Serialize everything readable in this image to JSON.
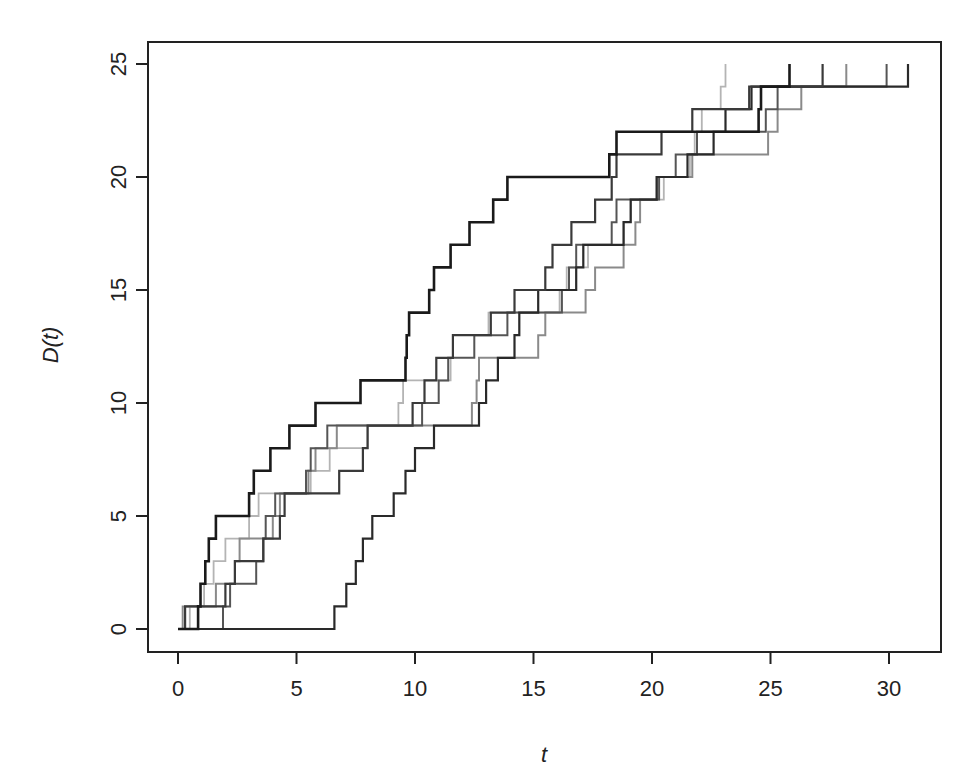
{
  "chart_data": {
    "type": "line",
    "subtype": "step",
    "title": "",
    "xlabel": "t",
    "ylabel": "D(t)",
    "xlim": [
      -1.2,
      32.2
    ],
    "ylim": [
      -1.0,
      25.9
    ],
    "xticks": [
      0,
      5,
      10,
      15,
      20,
      25,
      30
    ],
    "xtick_labels": [
      "0",
      "5",
      "10",
      "15",
      "20",
      "25",
      "30"
    ],
    "yticks": [
      0,
      5,
      10,
      15,
      20,
      25
    ],
    "ytick_labels": [
      "0",
      "5",
      "10",
      "15",
      "20",
      "25"
    ],
    "grid": false,
    "legend": null,
    "series": [
      {
        "name": "curve-1",
        "color": "#1a1a1a",
        "width": 2.6,
        "steps": [
          [
            0,
            0
          ],
          [
            0.85,
            1
          ],
          [
            0.95,
            2
          ],
          [
            1.15,
            3
          ],
          [
            1.3,
            4
          ],
          [
            1.6,
            5
          ],
          [
            3.0,
            6
          ],
          [
            3.2,
            7
          ],
          [
            3.9,
            8
          ],
          [
            4.7,
            9
          ],
          [
            5.8,
            10
          ],
          [
            7.7,
            11
          ],
          [
            9.6,
            12
          ],
          [
            9.65,
            13
          ],
          [
            9.75,
            14
          ],
          [
            10.6,
            15
          ],
          [
            10.8,
            16
          ],
          [
            11.5,
            17
          ],
          [
            12.3,
            18
          ],
          [
            13.3,
            19
          ],
          [
            13.9,
            20
          ],
          [
            18.2,
            21
          ],
          [
            18.5,
            22
          ],
          [
            24.5,
            23
          ],
          [
            24.6,
            24
          ],
          [
            25.8,
            25
          ]
        ]
      },
      {
        "name": "curve-2",
        "color": "#3a3a3a",
        "width": 2.2,
        "steps": [
          [
            0,
            0
          ],
          [
            0.3,
            1
          ],
          [
            2.0,
            2
          ],
          [
            2.4,
            3
          ],
          [
            3.6,
            4
          ],
          [
            4.3,
            5
          ],
          [
            4.5,
            6
          ],
          [
            6.8,
            7
          ],
          [
            7.8,
            8
          ],
          [
            8.0,
            9
          ],
          [
            9.9,
            10
          ],
          [
            10.4,
            11
          ],
          [
            10.9,
            12
          ],
          [
            11.6,
            13
          ],
          [
            13.2,
            14
          ],
          [
            14.2,
            15
          ],
          [
            15.5,
            16
          ],
          [
            15.8,
            17
          ],
          [
            16.6,
            18
          ],
          [
            17.6,
            19
          ],
          [
            18.3,
            20
          ],
          [
            18.5,
            21
          ],
          [
            20.4,
            22
          ],
          [
            21.7,
            23
          ],
          [
            24.1,
            24
          ],
          [
            27.2,
            25
          ]
        ]
      },
      {
        "name": "curve-3",
        "color": "#2a2a2a",
        "width": 2.2,
        "steps": [
          [
            0,
            0
          ],
          [
            6.6,
            1
          ],
          [
            7.1,
            2
          ],
          [
            7.5,
            3
          ],
          [
            7.8,
            4
          ],
          [
            8.2,
            5
          ],
          [
            9.1,
            6
          ],
          [
            9.6,
            7
          ],
          [
            10.0,
            8
          ],
          [
            10.8,
            9
          ],
          [
            12.7,
            10
          ],
          [
            13.0,
            11
          ],
          [
            13.5,
            12
          ],
          [
            14.2,
            13
          ],
          [
            14.4,
            14
          ],
          [
            15.2,
            15
          ],
          [
            16.8,
            16
          ],
          [
            17.1,
            17
          ],
          [
            18.8,
            18
          ],
          [
            19.1,
            19
          ],
          [
            20.2,
            20
          ],
          [
            21.5,
            21
          ],
          [
            22.6,
            22
          ],
          [
            23.1,
            23
          ],
          [
            24.2,
            24
          ],
          [
            30.8,
            25
          ]
        ]
      },
      {
        "name": "curve-4",
        "color": "#555555",
        "width": 2.0,
        "steps": [
          [
            0,
            0
          ],
          [
            1.9,
            1
          ],
          [
            2.2,
            2
          ],
          [
            3.3,
            3
          ],
          [
            3.6,
            4
          ],
          [
            3.7,
            5
          ],
          [
            4.1,
            6
          ],
          [
            5.4,
            7
          ],
          [
            5.6,
            8
          ],
          [
            6.3,
            9
          ],
          [
            10.3,
            10
          ],
          [
            11.0,
            11
          ],
          [
            11.4,
            12
          ],
          [
            12.5,
            13
          ],
          [
            13.9,
            14
          ],
          [
            16.2,
            15
          ],
          [
            16.5,
            16
          ],
          [
            16.8,
            17
          ],
          [
            18.3,
            18
          ],
          [
            18.5,
            19
          ],
          [
            20.3,
            20
          ],
          [
            21.0,
            21
          ],
          [
            21.9,
            22
          ],
          [
            24.8,
            23
          ],
          [
            25.3,
            24
          ],
          [
            29.9,
            25
          ]
        ]
      },
      {
        "name": "curve-5",
        "color": "#8a8a8a",
        "width": 2.0,
        "steps": [
          [
            0,
            0
          ],
          [
            0.2,
            1
          ],
          [
            1.6,
            2
          ],
          [
            2.4,
            3
          ],
          [
            2.6,
            4
          ],
          [
            4.0,
            5
          ],
          [
            4.3,
            6
          ],
          [
            5.5,
            7
          ],
          [
            5.8,
            8
          ],
          [
            6.7,
            9
          ],
          [
            12.4,
            10
          ],
          [
            12.6,
            11
          ],
          [
            12.7,
            12
          ],
          [
            15.2,
            13
          ],
          [
            15.5,
            14
          ],
          [
            17.2,
            15
          ],
          [
            17.6,
            16
          ],
          [
            18.8,
            17
          ],
          [
            19.3,
            18
          ],
          [
            19.5,
            19
          ],
          [
            20.2,
            20
          ],
          [
            21.7,
            21
          ],
          [
            24.9,
            22
          ],
          [
            25.3,
            23
          ],
          [
            26.3,
            24
          ],
          [
            28.2,
            25
          ]
        ]
      },
      {
        "name": "curve-6",
        "color": "#b4b4b4",
        "width": 1.8,
        "steps": [
          [
            0,
            0
          ],
          [
            0.5,
            1
          ],
          [
            1.1,
            2
          ],
          [
            1.5,
            3
          ],
          [
            2.0,
            4
          ],
          [
            3.0,
            5
          ],
          [
            3.4,
            6
          ],
          [
            5.6,
            7
          ],
          [
            6.4,
            8
          ],
          [
            8.0,
            9
          ],
          [
            9.3,
            10
          ],
          [
            9.5,
            11
          ],
          [
            11.5,
            12
          ],
          [
            11.6,
            13
          ],
          [
            13.1,
            14
          ],
          [
            16.1,
            15
          ],
          [
            16.4,
            16
          ],
          [
            17.3,
            17
          ],
          [
            18.8,
            18
          ],
          [
            19.1,
            19
          ],
          [
            20.5,
            20
          ],
          [
            21.6,
            21
          ],
          [
            21.8,
            22
          ],
          [
            22.1,
            23
          ],
          [
            22.9,
            24
          ],
          [
            23.1,
            25
          ]
        ]
      }
    ]
  },
  "layout": {
    "plot_left": 148,
    "plot_top": 42,
    "plot_right": 941,
    "plot_bottom": 652,
    "x0_px": 178,
    "x_px_per_unit": 23.7,
    "y0_px": 629,
    "y_px_per_unit": 22.6
  }
}
